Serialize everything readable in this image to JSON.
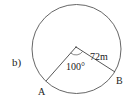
{
  "figure": {
    "part_label": "b)",
    "circle": {
      "cx": 76.5,
      "cy": 49,
      "r": 44.5,
      "stroke": "#555555"
    },
    "center": {
      "x": 76,
      "y": 47
    },
    "points": [
      {
        "name": "A",
        "label": "A",
        "x": 46,
        "y": 81,
        "label_x": 38,
        "label_y": 95
      },
      {
        "name": "B",
        "label": "B",
        "x": 115,
        "y": 72,
        "label_x": 116,
        "label_y": 84
      }
    ],
    "angle_label": "100°",
    "radius_label": "72m"
  }
}
